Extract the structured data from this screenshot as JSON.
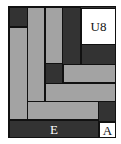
{
  "puzzle": {
    "colors": {
      "dark": "#333333",
      "gray": "#a3a3a3",
      "white": "#ffffff",
      "border": "#111111"
    },
    "pieces": [
      {
        "id": "dark-top-left",
        "color": "dark",
        "x": 0,
        "y": 0,
        "w": 19,
        "h": 20
      },
      {
        "id": "gray-col-1",
        "color": "gray",
        "x": 0,
        "y": 20,
        "w": 19,
        "h": 93
      },
      {
        "id": "gray-col-2",
        "color": "gray",
        "x": 18,
        "y": 0,
        "w": 18,
        "h": 95
      },
      {
        "id": "gray-col-3",
        "color": "gray",
        "x": 36,
        "y": 0,
        "w": 18,
        "h": 57
      },
      {
        "id": "dark-col",
        "color": "dark",
        "x": 53,
        "y": 0,
        "w": 19,
        "h": 58
      },
      {
        "id": "white-u8",
        "color": "white",
        "x": 72,
        "y": 1,
        "w": 35,
        "h": 37,
        "label": "U8"
      },
      {
        "id": "dark-right",
        "color": "dark",
        "x": 72,
        "y": 37,
        "w": 35,
        "h": 21
      },
      {
        "id": "dark-mid",
        "color": "dark",
        "x": 36,
        "y": 56,
        "w": 18,
        "h": 21
      },
      {
        "id": "gray-bar-1",
        "color": "gray",
        "x": 54,
        "y": 57,
        "w": 53,
        "h": 19
      },
      {
        "id": "gray-bar-2",
        "color": "gray",
        "x": 36,
        "y": 76,
        "w": 71,
        "h": 19
      },
      {
        "id": "gray-bar-3",
        "color": "gray",
        "x": 18,
        "y": 94,
        "w": 72,
        "h": 19
      },
      {
        "id": "dark-right-low",
        "color": "dark",
        "x": 89,
        "y": 94,
        "w": 18,
        "h": 21
      },
      {
        "id": "dark-bottom-e",
        "color": "dark",
        "x": 0,
        "y": 113,
        "w": 90,
        "h": 18,
        "label": "E"
      },
      {
        "id": "white-a",
        "color": "white",
        "x": 90,
        "y": 115,
        "w": 17,
        "h": 16,
        "label": "A"
      }
    ]
  }
}
